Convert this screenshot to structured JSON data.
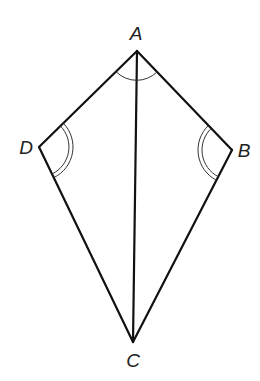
{
  "diagram": {
    "type": "geometry-kite",
    "vertices": {
      "A": {
        "label": "A",
        "x": 137,
        "y": 51,
        "label_x": 136,
        "label_y": 35
      },
      "B": {
        "label": "B",
        "x": 232,
        "y": 150,
        "label_x": 244,
        "label_y": 152
      },
      "C": {
        "label": "C",
        "x": 133,
        "y": 342,
        "label_x": 133,
        "label_y": 362
      },
      "D": {
        "label": "D",
        "x": 39,
        "y": 147,
        "label_x": 26,
        "label_y": 149
      }
    },
    "edges": [
      {
        "from": "A",
        "to": "B"
      },
      {
        "from": "B",
        "to": "C"
      },
      {
        "from": "C",
        "to": "D"
      },
      {
        "from": "D",
        "to": "A"
      },
      {
        "from": "A",
        "to": "C",
        "kind": "diagonal"
      }
    ],
    "angle_marks": [
      {
        "vertex": "A",
        "arcs": 1,
        "meaning": "angle DAB marked"
      },
      {
        "vertex": "D",
        "arcs": 2,
        "meaning": "angle ADC congruent to angle ABC"
      },
      {
        "vertex": "B",
        "arcs": 2,
        "meaning": "angle ABC congruent to angle ADC"
      }
    ],
    "colors": {
      "line": "#111111",
      "arc": "#333333",
      "background": "#ffffff"
    }
  }
}
